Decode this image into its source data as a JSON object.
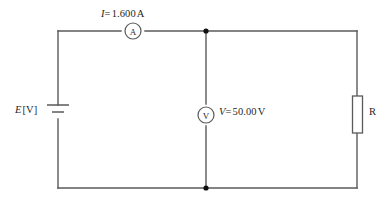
{
  "diagram": {
    "type": "electrical-schematic",
    "background_color": "#ffffff",
    "wire_color": "#5a5a5a",
    "node_color": "#101010"
  },
  "labels": {
    "current": {
      "symbol": "I",
      "equals": "=",
      "value": "1.600",
      "unit": "A",
      "full": "I = 1.600 A"
    },
    "emf": {
      "symbol": "E",
      "unit_bracket": "[V]",
      "full": "E [V]"
    },
    "voltage": {
      "symbol": "V",
      "equals": "=",
      "value": "50.00",
      "unit": "V",
      "full": "V = 50.00 V"
    },
    "resistor": {
      "symbol": "R",
      "full": "R"
    }
  },
  "components": {
    "ammeter": {
      "glyph": "A",
      "name": "ammeter",
      "shape": "circle"
    },
    "voltmeter": {
      "glyph": "V",
      "name": "voltmeter",
      "shape": "circle"
    },
    "battery": {
      "name": "battery",
      "shape": "two-plate-cell"
    },
    "resistor": {
      "name": "resistor",
      "shape": "rectangle"
    }
  },
  "nodes": [
    {
      "name": "top-junction",
      "x": 206,
      "y": 31
    },
    {
      "name": "bottom-junction",
      "x": 206,
      "y": 188
    }
  ]
}
